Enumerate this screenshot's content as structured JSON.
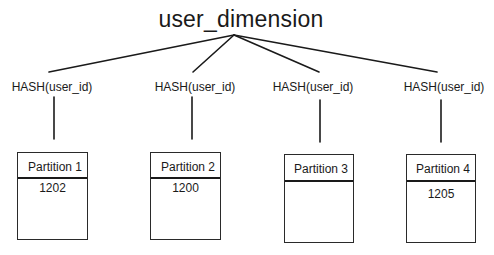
{
  "diagram": {
    "title": "user_dimension",
    "branches": [
      {
        "hash_label": "HASH(user_id)",
        "partition": {
          "label": "Partition 1",
          "value": "1202"
        }
      },
      {
        "hash_label": "HASH(user_id)",
        "partition": {
          "label": "Partition 2",
          "value": "1200"
        }
      },
      {
        "hash_label": "HASH(user_id)",
        "partition": {
          "label": "Partition 3",
          "value": ""
        }
      },
      {
        "hash_label": "HASH(user_id)",
        "partition": {
          "label": "Partition 4",
          "value": "1205"
        }
      }
    ],
    "colors": {
      "line": "#1a1a1a",
      "background": "#ffffff"
    }
  }
}
